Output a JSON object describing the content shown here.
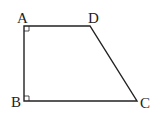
{
  "diagram": {
    "shape": "right trapezoid",
    "vertices": [
      "A",
      "B",
      "C",
      "D"
    ],
    "labels": {
      "A": "A",
      "B": "B",
      "C": "C",
      "D": "D"
    },
    "right_angles": [
      "A",
      "B"
    ],
    "stroke_color": "#222222"
  }
}
